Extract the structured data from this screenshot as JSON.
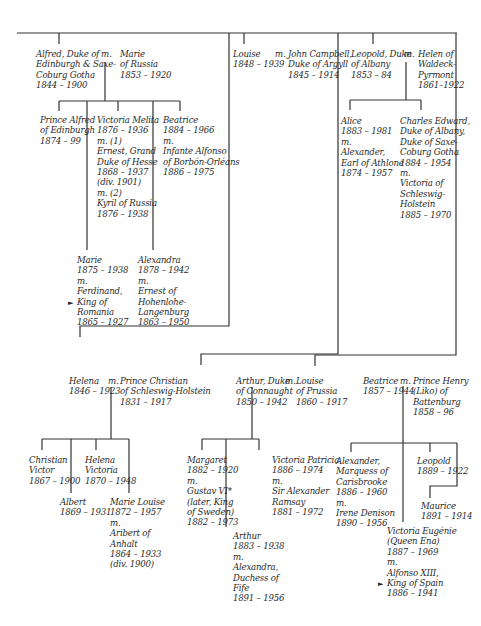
{
  "tree": {
    "alfred": {
      "name": "Alfred, Duke of\nEdinburgh & Saxe-\nCoburg Gotha\n1844 – 1900",
      "m": "m.",
      "spouse": "Marie\nof Russia\n1853 – 1920",
      "children": [
        {
          "text": "Prince Alfred\nof Edinburgh\n1874 – 99"
        },
        {
          "text": "Victoria Melita\n1876 – 1936\nm. (1)\nErnest, Grand\nDuke of Hesse\n1868 – 1937\n(div. 1901)\nm. (2)\nKyril of Russia\n1876 – 1938"
        },
        {
          "text": "Beatrice\n1884 – 1966\nm.\nInfante Alfonso\nof Borbón-Orléans\n1886 – 1975"
        },
        {
          "text": "Marie\n1875 – 1938\nm.\nFerdinand,\nKing of\nRomania\n1865 – 1927",
          "marker": "►"
        },
        {
          "text": "Alexandra\n1878 – 1942\nm.\nErnest of\nHohenlohe-\nLangenburg\n1863 – 1950"
        }
      ]
    },
    "louise": {
      "name": "Louise\n1848 – 1939",
      "m": "m.",
      "spouse": "John Campbell,\nDuke of Argyll\n1845 – 1914"
    },
    "leopold": {
      "name": "Leopold, Duke\nof Albany\n1853 – 84",
      "m": "m.",
      "spouse": "Helen of\nWaldeck-\nPyrmont\n1861–1922",
      "children": [
        {
          "text": "Alice\n1883 – 1981\nm.\nAlexander,\nEarl of Athlone\n1874 – 1957"
        },
        {
          "text": "Charles Edward,\nDuke of Albany,\nDuke of Saxe-\nCoburg Gotha\n1884 – 1954\nm.\nVictoria of\nSchleswig-\nHolstein\n1885 – 1970"
        }
      ]
    },
    "helena": {
      "name": "Helena\n1846 – 1923",
      "m": "m.",
      "spouse": "Prince Christian\nof Schleswig-Holstein\n1831 – 1917",
      "children": [
        {
          "text": "Christian\nVictor\n1867 – 1900"
        },
        {
          "text": "Helena\nVictoria\n1870 – 1948"
        },
        {
          "text": "Albert\n1869 – 1931"
        },
        {
          "text": "Marie Louise\n1872 – 1957\nm.\nAribert of\nAnhalt\n1864 – 1933\n(div. 1900)"
        }
      ]
    },
    "arthur": {
      "name": "Arthur, Duke\nof Connaught\n1850 – 1942",
      "m": "m.",
      "spouse": "Louise\nof Prussia\n1860 – 1917",
      "children": [
        {
          "text": "Margaret\n1882 – 1920\nm.\nGustav VI*\n(later, King\nof Sweden)\n1882 – 1973"
        },
        {
          "text": "Victoria Patricia\n1886 – 1974\nm.\nSir Alexander\nRamsay\n1881 – 1972"
        },
        {
          "text": "Arthur\n1883 – 1938\nm.\nAlexandra,\nDuchess of\nFife\n1891 – 1956"
        }
      ]
    },
    "beatrice": {
      "name": "Beatrice\n1857 – 1944",
      "m": "m.",
      "spouse": "Prince Henry\n(Liko) of\nBattenburg\n1858 – 96",
      "children": [
        {
          "text": "Alexander,\nMarquess of\nCarisbrooke\n1886 – 1960\nm.\nIrene Denison\n1890 – 1956"
        },
        {
          "text": "Leopold\n1889 – 1922"
        },
        {
          "text": "Maurice\n1891 – 1914"
        },
        {
          "text": "Victoria Eugénie\n(Queen Ena)\n1887 – 1969\nm.\nAlfonso XIII,\nKing of Spain\n1886 – 1941",
          "marker": "►"
        }
      ]
    }
  }
}
